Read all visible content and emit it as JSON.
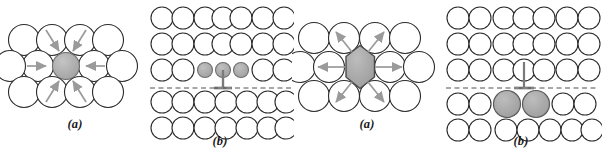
{
  "figure": {
    "background_color": "#ffffff",
    "width": 602,
    "height": 158
  },
  "style": {
    "circle_stroke": "#2b2b2b",
    "circle_fill": "#ffffff",
    "gray_fill": "#a9a9a9",
    "gray_fill_light": "#b4b4b4",
    "gray_stroke": "#6e6e6e",
    "arrow_color": "#9a9a9a",
    "dash_color": "#8c8c8c",
    "stem_color": "#7a7a7a",
    "caption_color": "#17171a"
  },
  "panels": [
    {
      "id": "panel-1",
      "caption": "(a)",
      "kind": "smaller-substitutional-local",
      "description": "Small substitutional impurity atom with neighboring host atoms pulled inward",
      "rows": 3,
      "circle_diameter": 31,
      "center_atom": {
        "type": "circle",
        "fill": "gray",
        "diameter": 27
      },
      "arrow_direction": "inward",
      "arrow_count": 6
    },
    {
      "id": "panel-2",
      "caption": "(b)",
      "kind": "smaller-substitutional-lattice",
      "description": "Lattice grid with three small gray substitutional atoms and an edge dislocation symbol on a dashed slip plane",
      "grid_columns": 7,
      "grid_rows": 5,
      "circle_diameter": 22,
      "gray_atom_count": 3,
      "gray_atom_diameter": 15,
      "gray_atom_row": 3,
      "gray_atom_columns": [
        3,
        4,
        5
      ],
      "dislocation_symbol": "inverted-tee",
      "slip_plane": "dashed"
    },
    {
      "id": "panel-3",
      "caption": "(a)",
      "kind": "larger-substitutional-local",
      "description": "Large substitutional impurity atom shown as a hexagon with neighboring host atoms pushed outward",
      "rows": 3,
      "circle_diameter": 31,
      "center_atom": {
        "type": "hexagon",
        "fill": "gray",
        "diameter": 40
      },
      "arrow_direction": "outward",
      "arrow_count": 6
    },
    {
      "id": "panel-4",
      "caption": "(b)",
      "kind": "larger-substitutional-lattice",
      "description": "Lattice grid with two large gray substitutional atoms below a dashed slip plane and an edge dislocation symbol",
      "grid_columns": 7,
      "grid_rows": 5,
      "circle_diameter": 22,
      "gray_atom_count": 2,
      "gray_atom_diameter": 27,
      "gray_atom_row": 4,
      "gray_atom_columns": [
        3,
        4
      ],
      "dislocation_symbol": "tee",
      "slip_plane": "dashed"
    }
  ]
}
